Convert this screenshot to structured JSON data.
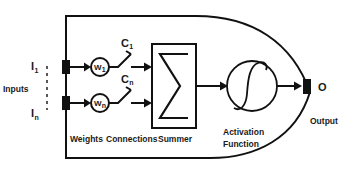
{
  "diagram": {
    "colors": {
      "line": "#111111",
      "text": "#1a1a1a",
      "background": "#ffffff"
    },
    "inputs": {
      "group_label": "Inputs",
      "first": {
        "base": "I",
        "sub": "1"
      },
      "last": {
        "base": "I",
        "sub": "n"
      }
    },
    "weights": {
      "section_label": "Weights",
      "first": {
        "base": "W",
        "sub": "1"
      },
      "last": {
        "base": "W",
        "sub": "n"
      }
    },
    "connections": {
      "section_label": "Connections",
      "first": {
        "base": "C",
        "sub": "1"
      },
      "last": {
        "base": "C",
        "sub": "n"
      }
    },
    "summer": {
      "section_label": "Summer",
      "symbol": "Σ"
    },
    "activation": {
      "section_label_line1": "Activation",
      "section_label_line2": "Function",
      "curve": "sigmoid"
    },
    "output": {
      "section_label": "Output",
      "terminal_label": "O"
    }
  }
}
